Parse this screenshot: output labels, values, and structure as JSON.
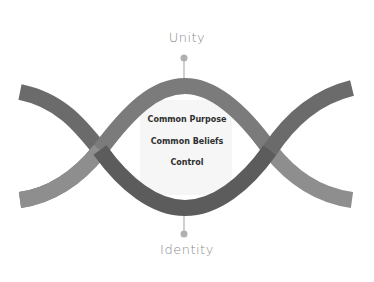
{
  "diagram": {
    "type": "double-helix",
    "top_label": "Unity",
    "bottom_label": "Identity",
    "center_items": [
      "Common Purpose",
      "Common Beliefs",
      "Control"
    ],
    "colors": {
      "band_dark": "#6b6b6b",
      "band_dark_center": "#5c5c5c",
      "band_light": "#8e8e8e",
      "band_light_center": "#7b7b7b",
      "pin": "#b0b0b0",
      "label": "#8a8a8a",
      "center_text": "#2e2e2e",
      "center_glow": "#f2f2f2"
    }
  }
}
